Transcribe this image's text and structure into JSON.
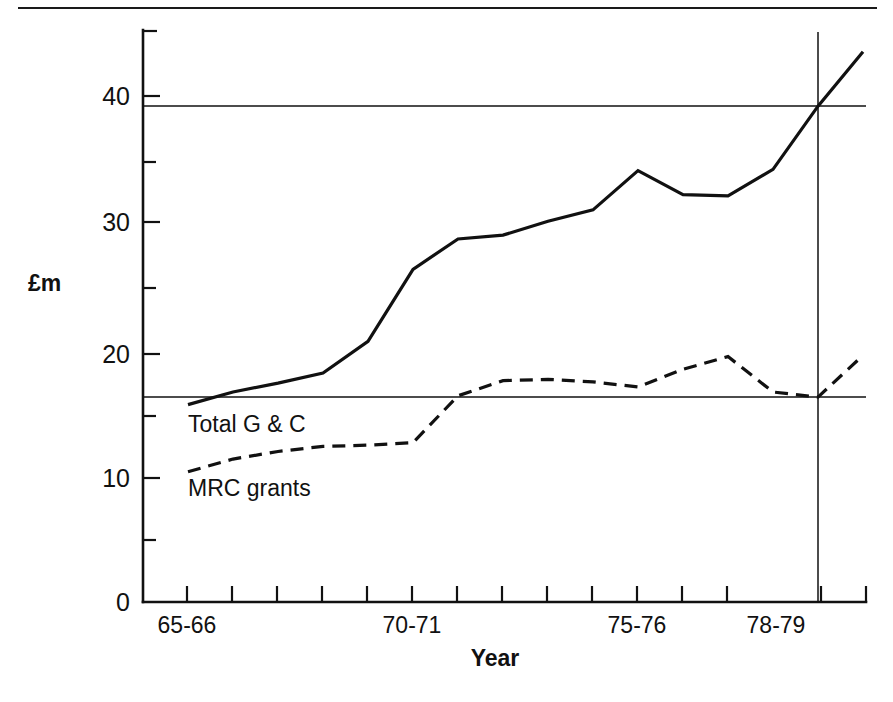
{
  "figure": {
    "kind": "line-chart",
    "background": "#ffffff",
    "ink_color": "#111111"
  },
  "chart_data": {
    "type": "line",
    "title": "",
    "xlabel": "Year",
    "ylabel": "£m",
    "ylim": [
      0,
      45
    ],
    "yticks_major": [
      0,
      10,
      20,
      30,
      40
    ],
    "yticks_minor": [
      5,
      15,
      25,
      35
    ],
    "grid": false,
    "legend": "inline-labels",
    "x": [
      "64-65",
      "65-66",
      "66-67",
      "67-68",
      "68-69",
      "69-70",
      "70-71",
      "71-72",
      "72-73",
      "73-74",
      "74-75",
      "75-76",
      "76-77",
      "77-78",
      "78-79",
      "79-80"
    ],
    "xtick_labels_shown": [
      "65-66",
      "70-71",
      "75-76",
      "78-79"
    ],
    "series": [
      {
        "name": "Total G & C",
        "style": "solid",
        "values": [
          15.6,
          16.6,
          17.3,
          18.1,
          20.6,
          26.3,
          28.7,
          29.0,
          30.1,
          31.0,
          34.1,
          32.2,
          32.1,
          34.2,
          39.2,
          43.5
        ]
      },
      {
        "name": "MRC grants",
        "style": "dashed",
        "values": [
          10.3,
          11.3,
          11.9,
          12.3,
          12.4,
          12.6,
          16.3,
          17.5,
          17.6,
          17.4,
          17.0,
          18.4,
          19.4,
          16.6,
          16.2,
          19.5
        ]
      }
    ],
    "reference_lines": {
      "horizontal": [
        {
          "value": 39.2,
          "label": "",
          "spans": "full-width"
        },
        {
          "value": 16.2,
          "label": "",
          "spans": "full-width"
        }
      ],
      "vertical": [
        {
          "at": "78-79",
          "label": "78-79"
        }
      ]
    },
    "annotations": [
      {
        "text": "Total G & C",
        "x": "65-66",
        "y": 15.0
      },
      {
        "text": "MRC grants",
        "x": "65-66",
        "y": 9.2
      }
    ]
  },
  "labels": {
    "y_axis_title": "£m",
    "x_axis_title": "Year",
    "y_ticks": [
      "40",
      "30",
      "20",
      "10",
      "0"
    ],
    "x_ticks": [
      "65-66",
      "70-71",
      "75-76",
      "78-79"
    ],
    "series_total": "Total G & C",
    "series_mrc": "MRC grants"
  }
}
